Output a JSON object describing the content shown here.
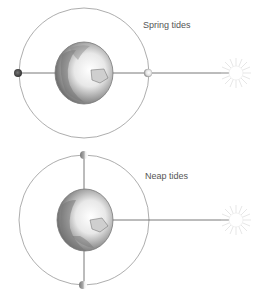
{
  "diagrams": [
    {
      "id": "spring",
      "label": "Spring tides",
      "label_pos": {
        "x": 143,
        "y": 26
      },
      "orbit": {
        "cx": 84,
        "cy": 73,
        "r": 65
      },
      "earth": {
        "cx": 84,
        "cy": 73,
        "rx": 29,
        "ry": 31
      },
      "moons": [
        {
          "cx": 18,
          "cy": 73,
          "shade": "dark"
        },
        {
          "cx": 148,
          "cy": 73,
          "shade": "light"
        }
      ],
      "sun": {
        "cx": 236,
        "cy": 73
      }
    },
    {
      "id": "neap",
      "label": "Neap tides",
      "label_pos": {
        "x": 145,
        "y": 177
      },
      "orbit": {
        "cx": 84,
        "cy": 220,
        "r": 65
      },
      "earth": {
        "cx": 85,
        "cy": 220,
        "rx": 28,
        "ry": 31
      },
      "moons": [
        {
          "cx": 84,
          "cy": 155,
          "shade": "half"
        },
        {
          "cx": 83,
          "cy": 285,
          "shade": "half"
        }
      ],
      "sun": {
        "cx": 236,
        "cy": 220
      }
    }
  ],
  "colors": {
    "orbit": "#8a8a8a",
    "line": "#555555",
    "earth_edge": "#7a7a7a",
    "text": "#555555"
  }
}
